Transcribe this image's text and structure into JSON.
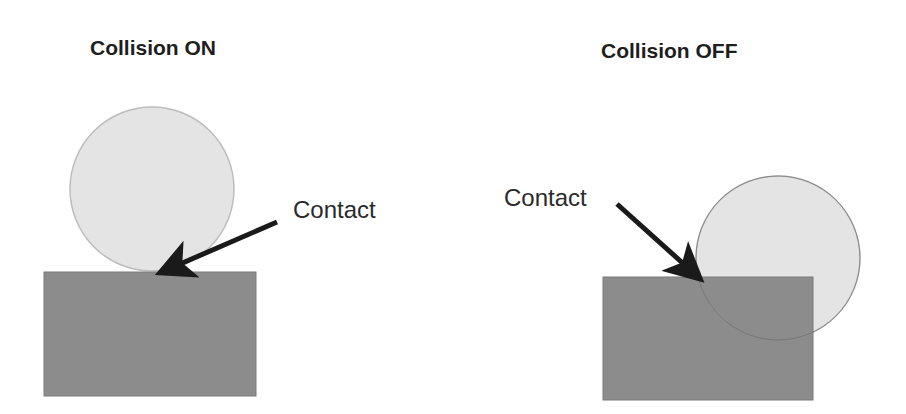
{
  "panels": [
    {
      "title": "Collision ON",
      "annotation": "Contact",
      "circle": {
        "cx": 152,
        "cy": 189,
        "r": 82,
        "fill": "#e4e4e4",
        "stroke": "#bdbdbd"
      },
      "box": {
        "x": 44,
        "y": 272,
        "w": 212,
        "h": 124,
        "fill": "#8c8c8c",
        "stroke": "#7a7a7a"
      },
      "arrow": {
        "x1": 277,
        "y1": 222,
        "x2": 164,
        "y2": 271
      }
    },
    {
      "title": "Collision OFF",
      "annotation": "Contact",
      "circle": {
        "cx": 778,
        "cy": 258,
        "r": 82,
        "fill": "#e4e4e4",
        "stroke": "#bdbdbd"
      },
      "box": {
        "x": 603,
        "y": 277,
        "w": 210,
        "h": 123,
        "fill": "#8c8c8c",
        "stroke": "#7a7a7a"
      },
      "arrow": {
        "x1": 617,
        "y1": 204,
        "x2": 697,
        "y2": 276
      }
    }
  ],
  "colors": {
    "arrow": "#1a1a1a",
    "text": "#222222",
    "background": "#ffffff"
  }
}
